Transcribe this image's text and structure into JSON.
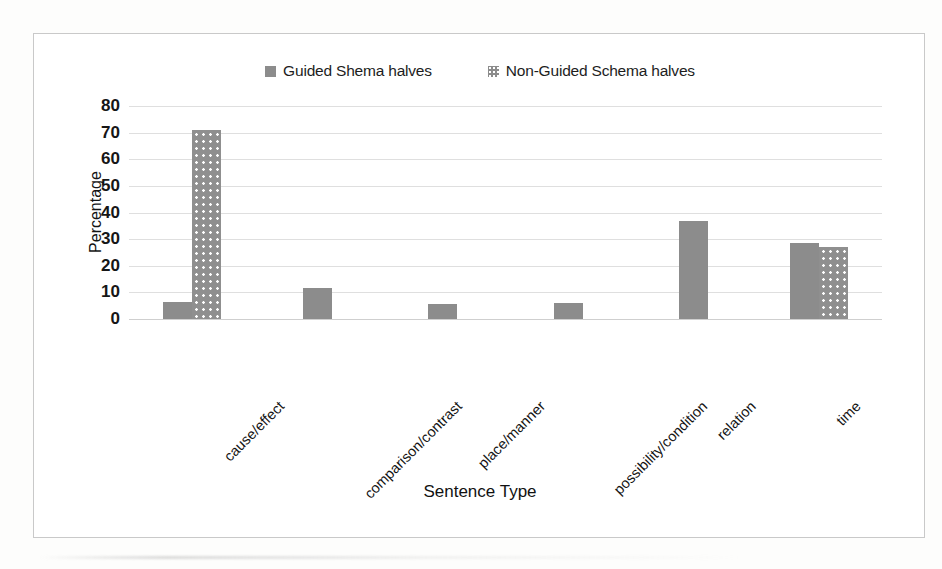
{
  "legend": {
    "entries": [
      {
        "label": "Guided Shema halves",
        "swatch": "solid-gray-swatch",
        "color": "#8c8c8c"
      },
      {
        "label": "Non-Guided Schema halves",
        "swatch": "dotted-gray-swatch",
        "color": "#8f8f8f"
      }
    ]
  },
  "axes": {
    "y_title": "Percentage",
    "x_title": "Sentence Type",
    "y_ticks": [
      "80",
      "70",
      "60",
      "50",
      "40",
      "30",
      "20",
      "10",
      "0"
    ]
  },
  "chart_data": {
    "type": "bar",
    "title": "",
    "xlabel": "Sentence Type",
    "ylabel": "Percentage",
    "ylim": [
      0,
      80
    ],
    "ytick_step": 10,
    "grid": true,
    "legend_position": "top-center",
    "categories": [
      "cause/effect",
      "comparison/contrast",
      "place/manner",
      "possibility/condition",
      "relation",
      "time"
    ],
    "series": [
      {
        "name": "Guided Shema halves",
        "color": "#8c8c8c",
        "fill": "solid",
        "values": [
          6.5,
          11.5,
          5.5,
          6,
          37,
          28.5
        ]
      },
      {
        "name": "Non-Guided Schema halves",
        "color": "#8f8f8f",
        "fill": "dotted",
        "values": [
          71,
          0,
          0,
          0,
          0,
          27
        ]
      }
    ]
  }
}
